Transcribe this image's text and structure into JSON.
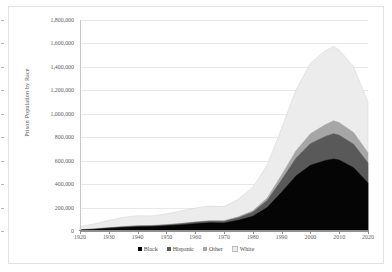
{
  "chart_data": {
    "type": "area",
    "stacked": true,
    "title": "",
    "xlabel": "",
    "ylabel": "Prison Population by Race",
    "xlim": [
      1920,
      2020
    ],
    "ylim": [
      0,
      1800000
    ],
    "grid": true,
    "legend_position": "bottom",
    "x_tick_labels": [
      "1920",
      "1930",
      "1940",
      "1950",
      "1960",
      "1970",
      "1980",
      "1990",
      "2000",
      "2010",
      "2020"
    ],
    "x_ticks": [
      1920,
      1930,
      1940,
      1950,
      1960,
      1970,
      1980,
      1990,
      2000,
      2010,
      2020
    ],
    "y_tick_labels": [
      "0",
      "200,000",
      "400,000",
      "600,000",
      "800,000",
      "1,000,000",
      "1,200,000",
      "1,400,000",
      "1,600,000",
      "1,800,000"
    ],
    "y_ticks": [
      0,
      200000,
      400000,
      600000,
      800000,
      1000000,
      1200000,
      1400000,
      1600000,
      1800000
    ],
    "x": [
      1920,
      1925,
      1930,
      1935,
      1940,
      1945,
      1950,
      1955,
      1960,
      1965,
      1970,
      1975,
      1980,
      1985,
      1990,
      1995,
      2000,
      2005,
      2008,
      2010,
      2015,
      2020
    ],
    "series": [
      {
        "name": "Black",
        "color": "#050505",
        "values": [
          8000,
          14000,
          22000,
          30000,
          36000,
          38000,
          44000,
          52000,
          62000,
          70000,
          68000,
          92000,
          125000,
          200000,
          330000,
          470000,
          560000,
          600000,
          615000,
          605000,
          540000,
          410000
        ]
      },
      {
        "name": "Hispanic",
        "color": "#595959",
        "values": [
          2000,
          3000,
          5000,
          6000,
          7000,
          7000,
          8000,
          10000,
          12000,
          14000,
          15000,
          22000,
          35000,
          60000,
          105000,
          150000,
          185000,
          205000,
          215000,
          212000,
          200000,
          170000
        ]
      },
      {
        "name": "Other",
        "color": "#a6a6a6",
        "values": [
          1000,
          1000,
          2000,
          2000,
          2000,
          2000,
          3000,
          3000,
          4000,
          4000,
          5000,
          8000,
          12000,
          22000,
          42000,
          65000,
          85000,
          100000,
          110000,
          108000,
          100000,
          88000
        ]
      },
      {
        "name": "White",
        "color": "#ececec",
        "values": [
          28000,
          42000,
          62000,
          78000,
          86000,
          82000,
          92000,
          105000,
          118000,
          125000,
          120000,
          150000,
          200000,
          280000,
          400000,
          520000,
          600000,
          630000,
          635000,
          620000,
          560000,
          430000
        ]
      }
    ]
  },
  "legend": {
    "items": [
      {
        "label": "Black",
        "swatch": "#050505"
      },
      {
        "label": "Hispanic",
        "swatch": "#595959"
      },
      {
        "label": "Other",
        "swatch": "#a6a6a6"
      },
      {
        "label": "White",
        "swatch": "#ececec"
      }
    ]
  }
}
